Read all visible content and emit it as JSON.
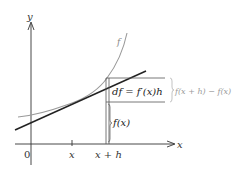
{
  "diagram": {
    "axes": {
      "x_label": "x",
      "y_label": "y",
      "origin_label": "0"
    },
    "ticks": {
      "x_tick": "x",
      "xh_tick": "x + h"
    },
    "curve_label": "f",
    "labels": {
      "differential": "df = f′(x)h",
      "increment": "f(x + h) − f(x)",
      "fx": "f(x)"
    },
    "colors": {
      "axis": "#333333",
      "curve": "#999999",
      "tangent": "#222222",
      "guide": "#555555",
      "increment_label": "#9a9a9a"
    }
  }
}
